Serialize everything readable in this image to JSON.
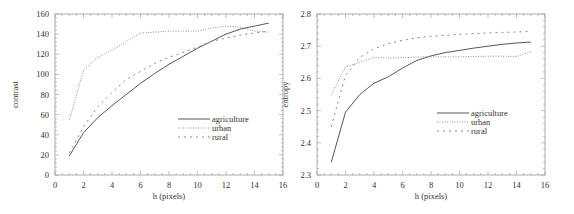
{
  "chart_data": [
    {
      "type": "line",
      "title": "",
      "xlabel": "h (pixels)",
      "ylabel": "contrast",
      "xlim": [
        0,
        16
      ],
      "ylim": [
        0,
        160
      ],
      "xticks": [
        0,
        2,
        4,
        6,
        8,
        10,
        12,
        14,
        16
      ],
      "yticks": [
        0,
        20,
        40,
        60,
        80,
        100,
        120,
        140,
        160
      ],
      "grid": false,
      "legend_position": "center-right",
      "x": [
        1,
        2,
        3,
        4,
        5,
        6,
        7,
        8,
        9,
        10,
        11,
        12,
        13,
        14,
        15
      ],
      "series": [
        {
          "name": "agriculture",
          "style": "solid",
          "values": [
            19,
            42,
            57,
            69,
            80,
            91,
            101,
            110,
            118,
            126,
            133,
            140,
            145,
            148,
            151
          ]
        },
        {
          "name": "urban",
          "style": "dotted",
          "values": [
            55,
            104,
            117,
            124,
            133,
            141,
            142,
            143,
            143,
            143,
            146,
            148,
            147,
            143,
            142
          ]
        },
        {
          "name": "rural",
          "style": "dashed",
          "values": [
            22,
            48,
            68,
            82,
            95,
            103,
            111,
            117,
            122,
            127,
            133,
            136,
            139,
            141,
            143
          ]
        }
      ]
    },
    {
      "type": "line",
      "title": "",
      "xlabel": "h (pixels)",
      "ylabel": "entropy",
      "xlim": [
        0,
        16
      ],
      "ylim": [
        2.3,
        2.8
      ],
      "xticks": [
        0,
        2,
        4,
        6,
        8,
        10,
        12,
        14,
        16
      ],
      "yticks": [
        2.3,
        2.4,
        2.5,
        2.6,
        2.7,
        2.8
      ],
      "grid": false,
      "legend_position": "center-right",
      "x": [
        1,
        2,
        3,
        4,
        5,
        6,
        7,
        8,
        9,
        10,
        11,
        12,
        13,
        14,
        15
      ],
      "series": [
        {
          "name": "agriculture",
          "style": "solid",
          "values": [
            2.34,
            2.495,
            2.55,
            2.585,
            2.605,
            2.632,
            2.656,
            2.67,
            2.68,
            2.687,
            2.694,
            2.7,
            2.706,
            2.71,
            2.713
          ]
        },
        {
          "name": "urban",
          "style": "dotted",
          "values": [
            2.55,
            2.635,
            2.65,
            2.665,
            2.663,
            2.665,
            2.666,
            2.667,
            2.667,
            2.667,
            2.668,
            2.669,
            2.669,
            2.668,
            2.683
          ]
        },
        {
          "name": "rural",
          "style": "dashed",
          "values": [
            2.45,
            2.61,
            2.665,
            2.692,
            2.708,
            2.718,
            2.726,
            2.731,
            2.734,
            2.737,
            2.739,
            2.741,
            2.743,
            2.744,
            2.746
          ]
        }
      ]
    }
  ]
}
